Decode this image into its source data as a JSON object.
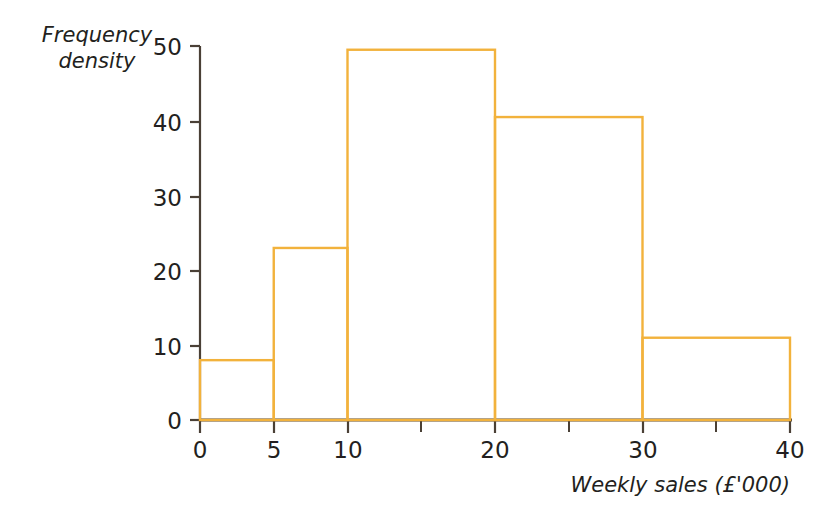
{
  "chart_data": {
    "type": "bar",
    "title": "",
    "subtitle": "",
    "xlabel": "Weekly sales (£'000)",
    "ylabel": "Frequency density",
    "ylabel_line1": "Frequency",
    "ylabel_line2": "density",
    "xlim": [
      0,
      40
    ],
    "ylim": [
      0,
      50
    ],
    "grid": false,
    "legend": false,
    "legend_position": "none",
    "bar_style": "histogram-outline",
    "x_ticks_major": [
      0,
      5,
      10,
      20,
      30,
      40
    ],
    "x_tick_labels": [
      "0",
      "5",
      "10",
      "20",
      "30",
      "40"
    ],
    "x_ticks_minor": [
      15,
      25,
      35
    ],
    "y_ticks": [
      0,
      10,
      20,
      30,
      40,
      50
    ],
    "y_tick_labels": [
      "0",
      "10",
      "20",
      "30",
      "40",
      "50"
    ],
    "bins": [
      {
        "label": "0-5",
        "x0": 0,
        "x1": 5,
        "frequency_density": 8,
        "frequency": 40
      },
      {
        "label": "5-10",
        "x0": 5,
        "x1": 10,
        "frequency_density": 23,
        "frequency": 115
      },
      {
        "label": "10-20",
        "x0": 10,
        "x1": 20,
        "frequency_density": 49.5,
        "frequency": 495
      },
      {
        "label": "20-30",
        "x0": 20,
        "x1": 30,
        "frequency_density": 40.5,
        "frequency": 405
      },
      {
        "label": "30-40",
        "x0": 30,
        "x1": 40,
        "frequency_density": 11,
        "frequency": 110
      }
    ],
    "categories": [
      "0-5",
      "5-10",
      "10-20",
      "20-30",
      "30-40"
    ],
    "values": [
      8,
      23,
      49.5,
      40.5,
      11
    ],
    "colors": {
      "bar_stroke": "#f2b23c",
      "bar_fill": "none",
      "axis_line": "#4a4036",
      "tick_mark": "#4a4036",
      "text": "#231f20",
      "background": "#ffffff"
    }
  }
}
